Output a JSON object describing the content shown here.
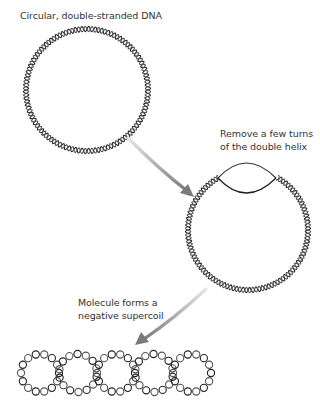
{
  "labels": {
    "circular_dna": "Circular, double-stranded DNA",
    "remove_turns_line1": "Remove a few turns",
    "remove_turns_line2": "of the double helix",
    "supercoil_line1": "Molecule forms a",
    "supercoil_line2": "negative supercoil"
  },
  "colors": {
    "strand": "#333333",
    "arrow": "#8a8a8a",
    "text": "#333333"
  },
  "figures": {
    "relaxed_circle": {
      "cx": 87,
      "cy": 90,
      "r": 61
    },
    "unwound_circle": {
      "cx": 248,
      "cy": 230,
      "r": 60,
      "unwound_segment": "top"
    },
    "supercoil": {
      "loops": 5,
      "cy": 373,
      "loop_r": 19,
      "start_cx": 40,
      "spacing": 38
    }
  }
}
